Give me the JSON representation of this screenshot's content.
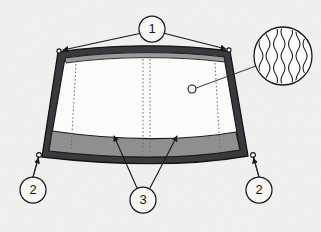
{
  "figure": {
    "type": "technical-illustration",
    "background_color": "#f4f4f2",
    "line_color": "#18181c",
    "band_color": "#8f8f8f",
    "glass_color": "#fbfbf9"
  },
  "callouts": [
    {
      "id": "callout-1",
      "label": "1",
      "cx": 152,
      "cy": 29,
      "r": 13,
      "description": "Upper corner arrows pointing to both top corners of the windshield",
      "arrow_targets": [
        {
          "x": 60,
          "y": 50
        },
        {
          "x": 228,
          "y": 49
        }
      ]
    },
    {
      "id": "callout-2-left",
      "label": "2",
      "cx": 33,
      "cy": 190,
      "r": 13,
      "description": "Lower left corner of windshield",
      "arrow_targets": [
        {
          "x": 39,
          "y": 156
        }
      ]
    },
    {
      "id": "callout-2-right",
      "label": "2",
      "cx": 259,
      "cy": 190,
      "r": 13,
      "description": "Lower right corner of windshield",
      "arrow_targets": [
        {
          "x": 253,
          "y": 156
        }
      ]
    },
    {
      "id": "callout-3",
      "label": "3",
      "cx": 143,
      "cy": 200,
      "r": 13,
      "description": "Two arrows pointing up into the lower shaded band of the glass",
      "arrow_targets": [
        {
          "x": 114,
          "y": 136
        },
        {
          "x": 177,
          "y": 136
        }
      ]
    }
  ],
  "detail": {
    "id": "magnified-detail",
    "cx": 283,
    "cy": 56,
    "r": 29,
    "pattern": "vertical-wavy-lines",
    "wave_count": 7,
    "marker": {
      "cx": 192,
      "cy": 89,
      "r": 4
    },
    "leader_from": {
      "x": 196,
      "y": 88
    },
    "leader_to": {
      "x": 256,
      "y": 66
    }
  },
  "glass": {
    "dashed_lines": [
      {
        "id": "dashed-left",
        "x1": 76,
        "y1": 64,
        "x2": 71,
        "y2": 148
      },
      {
        "id": "dashed-center-left",
        "x1": 143,
        "y1": 59,
        "x2": 143,
        "y2": 153
      },
      {
        "id": "dashed-center-right",
        "x1": 150,
        "y1": 59,
        "x2": 150,
        "y2": 153
      },
      {
        "id": "dashed-right",
        "x1": 215,
        "y1": 63,
        "x2": 219,
        "y2": 148
      }
    ]
  }
}
